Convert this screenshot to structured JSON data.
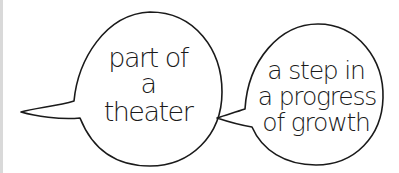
{
  "bubbles": [
    {
      "id": "left",
      "lines": [
        "part of",
        "a",
        "theater"
      ]
    },
    {
      "id": "right",
      "lines": [
        "a step in",
        "a progress",
        "of growth"
      ]
    }
  ],
  "colors": {
    "stroke": "#1a1a1a",
    "background": "#ffffff",
    "edge": "#d9d9d9"
  }
}
